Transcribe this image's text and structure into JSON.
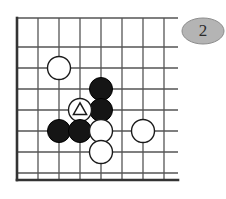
{
  "figure": {
    "kind": "go-board-diagram",
    "badge": {
      "label": "2",
      "shape": "ellipse",
      "fill": "#b4b4b4",
      "stroke": "#8c8c8c",
      "text_color": "#2b2b2b",
      "cx": 203,
      "cy": 31,
      "rx": 21,
      "ry": 13
    },
    "board": {
      "background": "#ffffff",
      "line_color": "#555555",
      "edge_color": "#333333",
      "line_width": 1.3,
      "edge_width": 2.6,
      "origin_x": 17,
      "origin_y": 18,
      "spacing": 21,
      "cols": 8,
      "rows": 8,
      "overhang": 14,
      "vertical_lines_x": [
        17,
        38,
        59,
        80,
        101,
        122,
        143,
        164
      ],
      "horizontal_lines_y": [
        18,
        47,
        68,
        89,
        110,
        131,
        152,
        173
      ],
      "edges": {
        "left_x": 17,
        "bottom_y": 180,
        "right_x": 178,
        "top_y": 18
      }
    },
    "stones": [
      {
        "id": "w1",
        "color": "white",
        "x": 59,
        "y": 68,
        "r": 11.5,
        "marker": "none"
      },
      {
        "id": "b1",
        "color": "black",
        "x": 101,
        "y": 89,
        "r": 11.5,
        "marker": "none"
      },
      {
        "id": "b2",
        "color": "black",
        "x": 101,
        "y": 110,
        "r": 11.5,
        "marker": "none"
      },
      {
        "id": "w2",
        "color": "white",
        "x": 80,
        "y": 110,
        "r": 11.5,
        "marker": "triangle"
      },
      {
        "id": "b3",
        "color": "black",
        "x": 59,
        "y": 131,
        "r": 11.5,
        "marker": "none"
      },
      {
        "id": "b4",
        "color": "black",
        "x": 80,
        "y": 131,
        "r": 11.5,
        "marker": "none"
      },
      {
        "id": "w3",
        "color": "white",
        "x": 101,
        "y": 131,
        "r": 11.5,
        "marker": "none"
      },
      {
        "id": "w4",
        "color": "white",
        "x": 143,
        "y": 131,
        "r": 11.5,
        "marker": "none"
      },
      {
        "id": "w5",
        "color": "white",
        "x": 101,
        "y": 152,
        "r": 11.5,
        "marker": "none"
      }
    ],
    "colors": {
      "black_stone_fill": "#151515",
      "black_stone_stroke": "#000000",
      "white_stone_fill": "#ffffff",
      "white_stone_stroke": "#1a1a1a",
      "marker_stroke": "#1a1a1a"
    }
  }
}
